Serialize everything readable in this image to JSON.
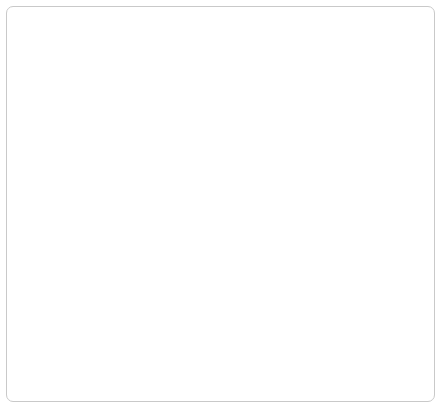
{
  "diagram": {
    "frame": {
      "border_color": "#c9c9c9",
      "background": "#ffffff"
    },
    "node_style": {
      "fill_top": "#f7f7f7",
      "fill_mid": "#e3e3e3",
      "border_color": "#dedede",
      "text_color": "#1d1d1d"
    },
    "connector_color": "#b0b0b0",
    "arrow_color": "#8e8e8e",
    "nodes": [
      {
        "id": "n1",
        "label": "주택가격 하락",
        "x": 78,
        "y": 17,
        "w": 114,
        "h": 21
      },
      {
        "id": "n2",
        "label": "신용경색",
        "x": 262,
        "y": 17,
        "w": 124,
        "h": 21
      },
      {
        "id": "n3",
        "label": "담보가치 하락, 순자산 감소",
        "x": 56,
        "y": 57,
        "w": 250,
        "h": 21
      },
      {
        "id": "n4",
        "label": "LTV 비율 상승",
        "x": 76,
        "y": 95,
        "w": 110,
        "h": 21
      },
      {
        "id": "n5",
        "label": "LTV 초과대출자 증가",
        "x": 56,
        "y": 133,
        "w": 160,
        "h": 21
      },
      {
        "id": "n6",
        "label": "원금상환압력 증가",
        "x": 56,
        "y": 170,
        "w": 194,
        "h": 21
      },
      {
        "id": "n7",
        "label": "신규대출 감소",
        "x": 262,
        "y": 170,
        "w": 124,
        "h": 21
      },
      {
        "id": "n8",
        "label": "가계부문 부채 축소",
        "x": 158,
        "y": 216,
        "w": 142,
        "h": 21
      },
      {
        "id": "n9",
        "label": "가계부문 현금흐름 악화",
        "x": 62,
        "y": 256,
        "w": 156,
        "h": 21
      },
      {
        "id": "n10",
        "label": "실물자산 매각압력 상승",
        "x": 250,
        "y": 256,
        "w": 156,
        "h": 21
      },
      {
        "id": "n11",
        "label": "주택가격 하락",
        "x": 262,
        "y": 291,
        "w": 114,
        "h": 21
      },
      {
        "id": "n12",
        "label": "소비 위축",
        "x": 152,
        "y": 331,
        "w": 166,
        "h": 21
      },
      {
        "id": "n13",
        "label": "경기부진, 물가하락",
        "x": 120,
        "y": 369,
        "w": 260,
        "h": 21
      }
    ],
    "edges": [
      {
        "from": "n1",
        "to": "n3",
        "label": ""
      },
      {
        "from": "n3",
        "to": "n4",
        "label": ""
      },
      {
        "from": "n4",
        "to": "n5",
        "label": ""
      },
      {
        "from": "n5",
        "to": "n6",
        "label": ""
      },
      {
        "from": "n3",
        "to": "n6",
        "label": ""
      },
      {
        "from": "n2",
        "to": "n6",
        "label": ""
      },
      {
        "from": "n2",
        "to": "n7",
        "label": ""
      },
      {
        "from": "n3",
        "to": "n7",
        "label": ""
      },
      {
        "from": "n6",
        "to": "n8",
        "label": ""
      },
      {
        "from": "n7",
        "to": "n8",
        "label": ""
      },
      {
        "from": "n8",
        "to": "n9",
        "label": ""
      },
      {
        "from": "n8",
        "to": "n10",
        "label": ""
      },
      {
        "from": "n10",
        "to": "n11",
        "label": ""
      },
      {
        "from": "n9",
        "to": "n12",
        "label": ""
      },
      {
        "from": "n11",
        "to": "n12",
        "label": ""
      },
      {
        "from": "n12",
        "to": "n13",
        "label": ""
      },
      {
        "from": "n11",
        "to": "n13",
        "label": ""
      }
    ]
  }
}
